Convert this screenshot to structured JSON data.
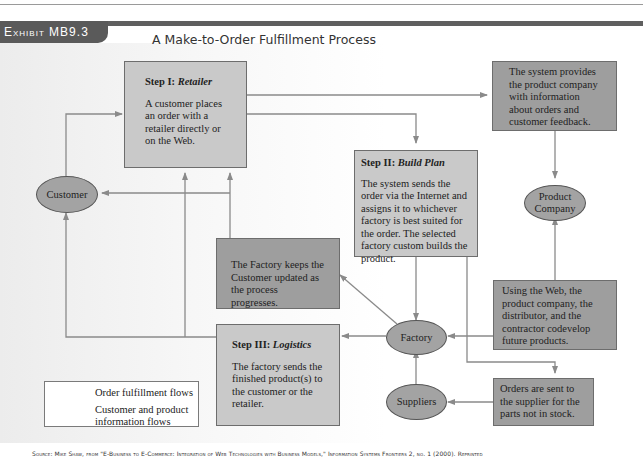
{
  "exhibit": {
    "label": "Exhibit MB9.3",
    "title": "A Make-to-Order Fulfillment Process"
  },
  "boxes": {
    "retailer": {
      "heading_prefix": "Step I: ",
      "heading_name": "Retailer",
      "text": "A customer places an order with a retailer directly or on the Web."
    },
    "system_info": {
      "text": "The system provides the product company with information about orders and customer feedback."
    },
    "build_plan": {
      "heading_prefix": "Step II: ",
      "heading_name": "Build Plan",
      "text": "The system sends the order via the Internet and assigns it to whichever factory is best suited for the order. The selected factory custom builds the product."
    },
    "factory_update": {
      "text": "The Factory keeps the Customer updated as the process progresses."
    },
    "codevelop": {
      "text": "Using the Web, the product company, the distributor, and the contractor codevelop future products."
    },
    "logistics": {
      "heading_prefix": "Step III: ",
      "heading_name": "Logistics",
      "text": "The factory sends the finished product(s) to the customer or the retailer."
    },
    "orders_suppliers": {
      "text": "Orders are sent to the supplier for the parts not in stock."
    }
  },
  "nodes": {
    "customer": "Customer",
    "product_company": "Product Company",
    "factory": "Factory",
    "suppliers": "Suppliers"
  },
  "legend": {
    "items": [
      {
        "label": "Order fulfillment flows",
        "color": "#8a8a8a"
      },
      {
        "label": "Customer and product information flows",
        "color": "#8a8a8a"
      }
    ]
  },
  "colors": {
    "light_box": "#c9c9c9",
    "dark_box": "#9e9e9e",
    "oval": "#a3a3a3",
    "line": "#8a8a8a",
    "band": "#5f5f5f"
  },
  "source": "Source: Mike Shaw, from \"E-Business to E-Commerce: Integration of Web Technologies with Business Models,\" Information Systems Frontiers 2, no. 1 (2000). Reprinted"
}
